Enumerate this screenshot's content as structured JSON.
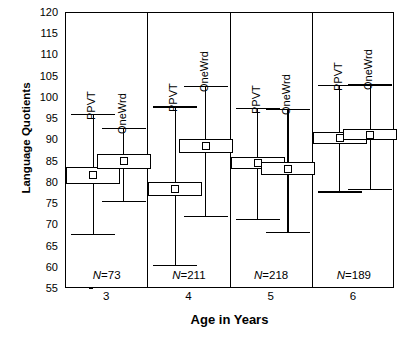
{
  "chart_data": {
    "type": "box",
    "title": "",
    "xlabel": "Age in Years",
    "ylabel": "Language Quotients",
    "ylim": [
      55,
      120
    ],
    "ytick_step": 5,
    "yticks": [
      120,
      115,
      110,
      105,
      100,
      95,
      90,
      85,
      80,
      75,
      70,
      65,
      60,
      55
    ],
    "grid": false,
    "legend": "none (series labeled in-panel)",
    "series_names": [
      "PPVT",
      "OneWrd"
    ],
    "categories": [
      "3",
      "4",
      "5",
      "6"
    ],
    "group_counts": [
      "N=73",
      "N=211",
      "N=218",
      "N=189"
    ],
    "groups": [
      {
        "category": "3",
        "n_label": "N=73",
        "n": 73,
        "boxes": [
          {
            "name": "PPVT",
            "whisker_low": 68.0,
            "box_low": 79.8,
            "mean": 81.8,
            "box_high": 83.8,
            "whisker_high": 96.2
          },
          {
            "name": "OneWrd",
            "whisker_low": 75.7,
            "box_low": 83.3,
            "mean": 85.1,
            "box_high": 86.8,
            "whisker_high": 92.9
          }
        ]
      },
      {
        "category": "4",
        "n_label": "N=211",
        "n": 211,
        "boxes": [
          {
            "name": "PPVT",
            "whisker_low": 60.6,
            "box_low": 77.0,
            "mean": 78.5,
            "box_high": 80.2,
            "whisker_high": 98.0
          },
          {
            "name": "OneWrd",
            "whisker_low": 72.2,
            "box_low": 87.0,
            "mean": 88.7,
            "box_high": 90.3,
            "whisker_high": 102.8
          }
        ]
      },
      {
        "category": "5",
        "n_label": "N=218",
        "n": 218,
        "boxes": [
          {
            "name": "PPVT",
            "whisker_low": 71.5,
            "box_low": 83.3,
            "mean": 84.7,
            "box_high": 86.2,
            "whisker_high": 97.6
          },
          {
            "name": "OneWrd",
            "whisker_low": 68.4,
            "box_low": 81.9,
            "mean": 83.3,
            "box_high": 84.8,
            "whisker_high": 97.4
          }
        ]
      },
      {
        "category": "6",
        "n_label": "N=189",
        "n": 189,
        "boxes": [
          {
            "name": "PPVT",
            "whisker_low": 78.0,
            "box_low": 89.2,
            "mean": 90.6,
            "box_high": 92.0,
            "whisker_high": 103.0
          },
          {
            "name": "OneWrd",
            "whisker_low": 78.5,
            "box_low": 90.0,
            "mean": 91.3,
            "box_high": 92.7,
            "whisker_high": 103.2
          }
        ]
      }
    ]
  }
}
